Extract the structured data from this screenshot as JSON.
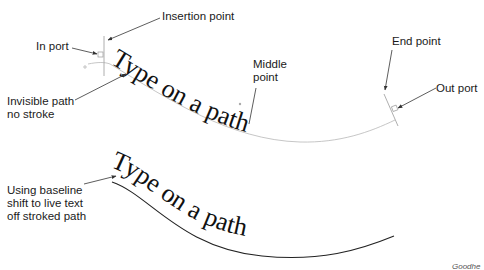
{
  "diagram": {
    "title": "Type on a path",
    "top_example": {
      "path_text": "Type on a path",
      "labels": {
        "insertion_point": "Insertion point",
        "in_port": "In port",
        "invisible_path": "Invisible path\nno stroke",
        "middle_point": "Middle\npoint",
        "end_point": "End point",
        "out_port": "Out port"
      }
    },
    "bottom_example": {
      "path_text": "Type on a path",
      "labels": {
        "baseline_shift": "Using baseline\nshift to live text\noff stroked path"
      }
    },
    "credit": "Goodhe"
  },
  "colors": {
    "text": "#111111",
    "invisible_path": "#b8b8b8",
    "stroked_path": "#222222",
    "leader_line": "#333333"
  }
}
